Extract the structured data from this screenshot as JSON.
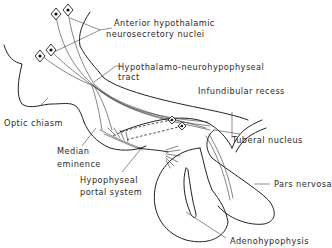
{
  "figure": {
    "labels": {
      "anterior_nuclei_line1": "Anterior hypothalamic",
      "anterior_nuclei_line2": "neurosecretory nuclei",
      "tract_line1": "Hypothalamo-neurohypophyseal",
      "tract_line2": "tract",
      "infundibular_recess": "Infundibular recess",
      "optic_chiasm": "Optic chiasm",
      "tuberal_nucleus": "Tuberal nucleus",
      "median_eminence_line1": "Median",
      "median_eminence_line2": "eminence",
      "portal_line1": "Hypophyseal",
      "portal_line2": "portal system",
      "pars_nervosa": "Pars nervosa",
      "adenohypophysis": "Adenohypophysis"
    },
    "colors": {
      "ink": "#222222",
      "background": "#ffffff"
    }
  }
}
